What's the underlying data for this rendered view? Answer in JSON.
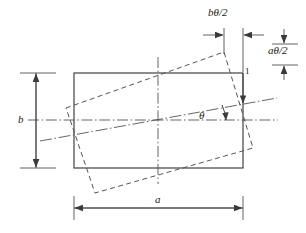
{
  "figure": {
    "type": "engineering-diagram",
    "colors": {
      "line": "#3a3a3a",
      "dashed": "#5a5a5a",
      "centerline": "#4a4a4a",
      "text": "#1a1a1a",
      "background": "#ffffff"
    },
    "labels": {
      "b_theta_over_2": "bθ/2",
      "a_theta_over_2": "aθ/2",
      "b_dimension": "b",
      "a_dimension": "a",
      "theta_angle": "θ",
      "callout_one": "1"
    },
    "geometry": {
      "nominal_rectangle": {
        "style": "solid",
        "x1": 74,
        "y1": 73,
        "x2": 243,
        "y2": 168,
        "width_label": "a",
        "height_label": "b"
      },
      "rotated_rectangle": {
        "style": "dashed",
        "rotation_deg": 9.5,
        "corners": [
          {
            "x": 66,
            "y": 108
          },
          {
            "x": 224,
            "y": 52
          },
          {
            "x": 253,
            "y": 148
          },
          {
            "x": 95,
            "y": 193
          }
        ]
      },
      "center": {
        "x": 158,
        "y": 120
      },
      "horizontal_centerline": {
        "x1": 28,
        "y1": 120,
        "x2": 278,
        "y2": 120
      },
      "vertical_centerline": {
        "x1": 158,
        "y1": 57,
        "x2": 158,
        "y2": 184
      },
      "rotated_centerline": {
        "x1": 40,
        "y1": 141,
        "x2": 277,
        "y2": 98
      },
      "offset_b_dimension": {
        "from_x": 224,
        "to_x": 243,
        "y": 35
      },
      "offset_a_dimension": {
        "from_y": 33,
        "to_y": 65,
        "x": 284
      },
      "b_dimension_line": {
        "x": 36,
        "y1": 73,
        "y2": 168
      },
      "a_dimension_line": {
        "y": 207,
        "x1": 74,
        "x2": 243
      }
    }
  }
}
